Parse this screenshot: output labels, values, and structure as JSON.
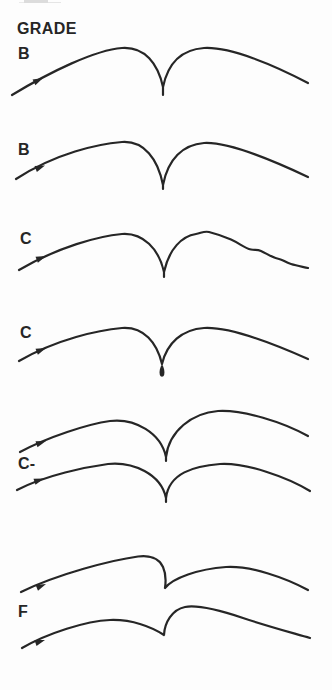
{
  "meta": {
    "background_color": "#fdfdfd",
    "ink_color": "#262626",
    "artifact_color": "#d9d9d9"
  },
  "header": {
    "title": "GRADE"
  },
  "figures": [
    {
      "grade": "B",
      "shape": "smooth double arc meeting in a cusp with short straight tail",
      "curves": [
        "M12,95 C50,72 95,50 122,48 C145,46.5 158,64 163,87 L163,95 M163,87 C168,63 182,49.5 204,48 C230,46.5 274,65 308,83"
      ],
      "arrows": [
        "43,78 35.4,85.3 32.6,79.5"
      ]
    },
    {
      "grade": "B",
      "shape": "smooth double arc with deep narrow cusp",
      "curves": [
        "M16,179 C56,153 98,144 122,142 C144,140.5 158,159 163,185 L163,189 M163,185 C168,159 183,144.5 204,143 C229,141.5 272,160 308,177"
      ],
      "arrows": [
        "45,165.5 36.9,172.1 34.5,166.1"
      ]
    },
    {
      "grade": "C",
      "shape": "cusp with wobbly irregular right-hand arc",
      "curves": [
        "M19,270 C58,247 99,236 122,234 C143,232.5 159,249 164,272 L164,277 M164,272 C169,249 182,236 196,234 C201,233.2 204,230.8 209,232 C215,233.5 224,236.5 231,239.5 C240,243.5 244,248 251,249.5 C255,250.4 257,249.2 261,251 C267,253.7 272,257.5 279,259 C283,259.8 285,262.2 291,264 C297,265.8 303,266.8 308,268"
      ],
      "arrows": [
        "46,256 37.9,262.8 35.5,256.8"
      ]
    },
    {
      "grade": "C",
      "shape": "cusp with ink blob (teardrop) at the bottom",
      "curves": [
        "M19,361 C57,339 99,330 122,328 C144,326.5 157,343 162,364 M162,364 C167,343 182,329.5 204,328 C229,326.5 272,343 308,359"
      ],
      "blob": "M162,364 C164,367.5 165,371.5 164.2,374.8 C163.6,377.3 160.4,377.3 159.8,374.8 C159,371.5 160,367.5 162,364 Z",
      "arrows": [
        "46,348 37.9,354.8 35.5,348.8"
      ]
    },
    {
      "grade": "C-",
      "shape": "two stacked strokes, cusps slightly offset, right arcs rising higher",
      "curves": [
        "M20,452 C48,437 88,424 110,421 C135,418 161,433 166,457 L166,461 M166,457 C169,431 192,413 218,411 C243,409.5 283,422 308,436",
        "M17,490 C46,475 86,467 108,464 C133,461.5 161,474 166,498 L166,502 M166,498 C169,473 194,466 220,464 C246,462.5 287,477 310,491"
      ],
      "arrows": [
        "46,441 37.5,447.2 35.5,441.2",
        "44,478.5 35.5,484.7 33.5,478.7"
      ]
    },
    {
      "grade": "F",
      "shape": "two stacked strokes with hooked overhanging retrace instead of clean cusp",
      "curves": [
        "M21,592 C58,574 112,560 138,556.5 C149,555 159,558 163,567 C165.5,572.5 166,581 165,588 M165,588 C173,578 198,569 226,567 C251,565.5 286,578 308,590",
        "M22,648 C48,633 86,621 110,620 C132,619.2 152,627 164,635 M164,635 C164.5,623 172,609.5 185,607 C198,604.5 222,611 243,618 C267,626 293,633 310,638"
      ],
      "arrows": [
        "46,584 38,590.8 35.6,585",
        "45,640 36.5,646.1 34.5,640.1"
      ]
    }
  ]
}
